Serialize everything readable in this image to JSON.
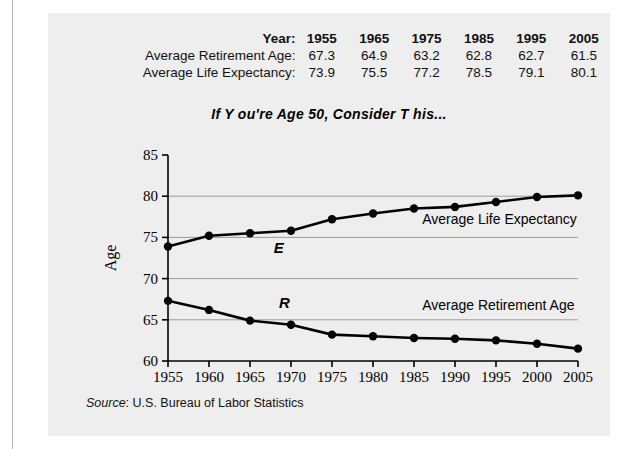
{
  "table": {
    "header_label": "Year:",
    "years": [
      "1955",
      "1965",
      "1975",
      "1985",
      "1995",
      "2005"
    ],
    "rows": [
      {
        "label": "Average Retirement Age:",
        "values": [
          "67.3",
          "64.9",
          "63.2",
          "62.8",
          "62.7",
          "61.5"
        ]
      },
      {
        "label": "Average Life Expectancy:",
        "values": [
          "73.9",
          "75.5",
          "77.2",
          "78.5",
          "79.1",
          "80.1"
        ]
      }
    ]
  },
  "title": "If Y ou're  Age  50,  Consider T his...",
  "source": {
    "word": "Source",
    "text": ": U.S. Bureau of Labor Statistics"
  },
  "chart_data": {
    "type": "line",
    "title": "If Y ou're  Age  50,  Consider T his...",
    "xlabel": "Year",
    "ylabel": "Age",
    "xlim": [
      1955,
      2005
    ],
    "ylim": [
      60,
      85
    ],
    "xticks": [
      "1955",
      "1960",
      "1965",
      "1970",
      "1975",
      "1980",
      "1985",
      "1990",
      "1995",
      "2000",
      "2005"
    ],
    "yticks": [
      "60",
      "65",
      "70",
      "75",
      "80",
      "85"
    ],
    "gridlines_y": [
      65,
      70,
      75,
      80
    ],
    "grid": true,
    "legend": "inline-labels",
    "x": [
      1955,
      1960,
      1965,
      1970,
      1975,
      1980,
      1985,
      1990,
      1995,
      2000,
      2005
    ],
    "series": [
      {
        "name": "Average Life Expectancy",
        "marker_letter": "E",
        "color": "#000000",
        "values": [
          73.9,
          75.2,
          75.5,
          75.8,
          77.2,
          77.9,
          78.5,
          78.7,
          79.3,
          79.9,
          80.1
        ]
      },
      {
        "name": "Average Retirement Age",
        "marker_letter": "R",
        "color": "#000000",
        "values": [
          67.3,
          66.2,
          64.9,
          64.4,
          63.2,
          63.0,
          62.8,
          62.7,
          62.5,
          62.1,
          61.5
        ]
      }
    ]
  }
}
